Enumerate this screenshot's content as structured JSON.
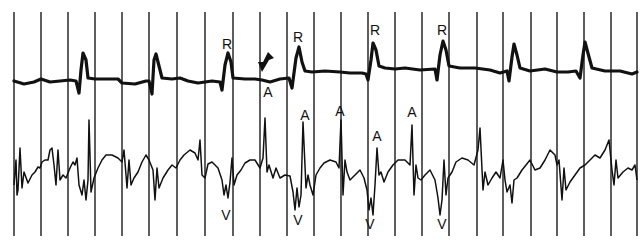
{
  "figure": {
    "background": "#ffffff",
    "ink_color": "#111111",
    "gridlines_x": [
      14,
      41,
      68,
      95,
      122,
      149,
      177,
      205,
      233,
      260,
      287,
      314,
      341,
      368,
      395,
      422,
      449,
      477,
      503,
      531,
      557,
      584,
      611,
      637
    ],
    "gridline_top": 12,
    "gridline_bottom": 236
  },
  "traces": {
    "upper": {
      "name": "surface ECG lead",
      "baseline_y": 81,
      "r_wave_x": [
        83,
        155,
        228,
        298,
        372,
        442,
        513,
        583
      ]
    },
    "lower": {
      "name": "intracardiac electrogram",
      "baseline_y": 175
    }
  },
  "labels": {
    "R": [
      {
        "text": "R",
        "x": 227,
        "y": 44
      },
      {
        "text": "R",
        "x": 298,
        "y": 37
      },
      {
        "text": "R",
        "x": 375,
        "y": 30
      },
      {
        "text": "R",
        "x": 442,
        "y": 30
      }
    ],
    "A": [
      {
        "text": "A",
        "x": 268,
        "y": 92
      },
      {
        "text": "A",
        "x": 305,
        "y": 115
      },
      {
        "text": "A",
        "x": 340,
        "y": 111
      },
      {
        "text": "A",
        "x": 377,
        "y": 136
      },
      {
        "text": "A",
        "x": 412,
        "y": 112
      }
    ],
    "V": [
      {
        "text": "V",
        "x": 226,
        "y": 215
      },
      {
        "text": "V",
        "x": 298,
        "y": 220
      },
      {
        "text": "V",
        "x": 370,
        "y": 224
      },
      {
        "text": "V",
        "x": 442,
        "y": 224
      }
    ]
  },
  "annotations": {
    "arrow": {
      "x": 265,
      "y": 60,
      "direction": "down-left",
      "meaning": "marker pointing to atrial event"
    }
  }
}
